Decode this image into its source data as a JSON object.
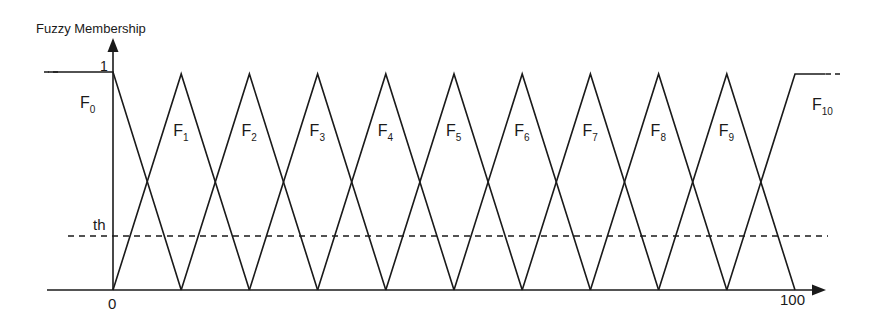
{
  "chart_data": {
    "type": "line",
    "title": "",
    "ylabel": "Fuzzy Membership",
    "xlabel": "",
    "x_ticks": [
      "0",
      "100"
    ],
    "y_ticks": [
      "1"
    ],
    "threshold_label": "th",
    "threshold_value": 0.25,
    "xlim": [
      0,
      100
    ],
    "ylim": [
      0,
      1
    ],
    "grid": false,
    "series": [
      {
        "name": "F0",
        "sub": "0",
        "points": [
          [
            -10,
            1
          ],
          [
            0,
            1
          ],
          [
            10,
            0
          ]
        ]
      },
      {
        "name": "F1",
        "sub": "1",
        "points": [
          [
            0,
            0
          ],
          [
            10,
            1
          ],
          [
            20,
            0
          ]
        ]
      },
      {
        "name": "F2",
        "sub": "2",
        "points": [
          [
            10,
            0
          ],
          [
            20,
            1
          ],
          [
            30,
            0
          ]
        ]
      },
      {
        "name": "F3",
        "sub": "3",
        "points": [
          [
            20,
            0
          ],
          [
            30,
            1
          ],
          [
            40,
            0
          ]
        ]
      },
      {
        "name": "F4",
        "sub": "4",
        "points": [
          [
            30,
            0
          ],
          [
            40,
            1
          ],
          [
            50,
            0
          ]
        ]
      },
      {
        "name": "F5",
        "sub": "5",
        "points": [
          [
            40,
            0
          ],
          [
            50,
            1
          ],
          [
            60,
            0
          ]
        ]
      },
      {
        "name": "F6",
        "sub": "6",
        "points": [
          [
            50,
            0
          ],
          [
            60,
            1
          ],
          [
            70,
            0
          ]
        ]
      },
      {
        "name": "F7",
        "sub": "7",
        "points": [
          [
            60,
            0
          ],
          [
            70,
            1
          ],
          [
            80,
            0
          ]
        ]
      },
      {
        "name": "F8",
        "sub": "8",
        "points": [
          [
            70,
            0
          ],
          [
            80,
            1
          ],
          [
            90,
            0
          ]
        ]
      },
      {
        "name": "F9",
        "sub": "9",
        "points": [
          [
            80,
            0
          ],
          [
            90,
            1
          ],
          [
            100,
            0
          ]
        ]
      },
      {
        "name": "F10",
        "sub": "10",
        "points": [
          [
            90,
            0
          ],
          [
            100,
            1
          ],
          [
            110,
            1
          ]
        ]
      }
    ]
  }
}
